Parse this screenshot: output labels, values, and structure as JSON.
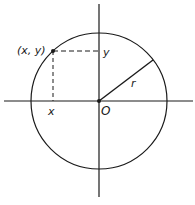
{
  "diagram": {
    "labels": {
      "point": "(x, y)",
      "y_label": "y",
      "x_label": "x",
      "origin": "O",
      "radius": "r"
    },
    "colors": {
      "stroke": "#1a1a1a",
      "background": "#ffffff"
    }
  }
}
